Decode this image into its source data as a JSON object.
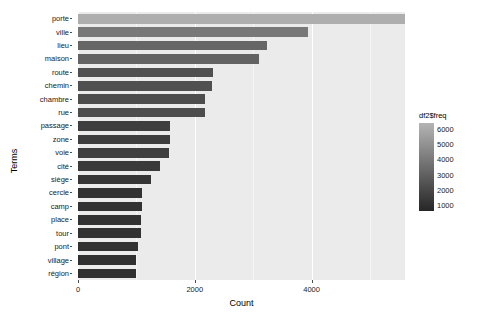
{
  "chart_data": {
    "type": "bar",
    "orientation": "horizontal",
    "title": "",
    "xlabel": "Count",
    "ylabel": "Terms",
    "xlim": [
      0,
      5600
    ],
    "xticks": [
      0,
      2000,
      4000,
      6000
    ],
    "xticklabels": [
      "0",
      "2000",
      "4000",
      "6000"
    ],
    "grid": true,
    "categories": [
      "porte",
      "ville",
      "lieu",
      "maison",
      "route",
      "chemin",
      "chambre",
      "rue",
      "passage",
      "zone",
      "voie",
      "cité",
      "siège",
      "cercle",
      "camp",
      "place",
      "tour",
      "pont",
      "village",
      "région"
    ],
    "values": [
      6150,
      3940,
      3230,
      3095,
      2310,
      2300,
      2180,
      2175,
      1580,
      1570,
      1565,
      1400,
      1255,
      1095,
      1090,
      1085,
      1080,
      1035,
      1000,
      990
    ],
    "legend": {
      "title": "df2$freq",
      "type": "continuous-colorbar",
      "position": "right",
      "ticks": [
        6000,
        5000,
        4000,
        3000,
        2000,
        1000
      ],
      "ticklabels": [
        "6000",
        "5000",
        "4000",
        "3000",
        "2000",
        "1000"
      ],
      "gradient_low": "#262626",
      "gradient_high": "#b4b4b4",
      "domain": [
        600,
        6400
      ]
    },
    "panel_background": "#ebebeb",
    "gridline_color": "#ffffff"
  }
}
